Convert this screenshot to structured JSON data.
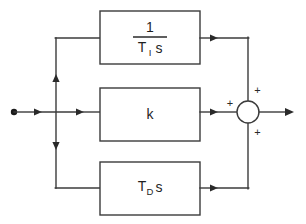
{
  "diagram": {
    "type": "control-block-diagram",
    "colors": {
      "line": "#3b3b3b",
      "text": "#1f1f1f",
      "background": "#ffffff",
      "arrow": "#2a2a2a"
    },
    "input": {
      "node_label": "",
      "dot_name": "input-node-dot"
    },
    "blocks": [
      {
        "id": "integral",
        "role": "integral-term",
        "numerator": "1",
        "denominator_base": "T",
        "denominator_subscript": "I",
        "denominator_suffix": "s",
        "plain_text": "1 / (T_I s)"
      },
      {
        "id": "proportional",
        "role": "proportional-term",
        "label": "k",
        "plain_text": "k"
      },
      {
        "id": "derivative",
        "role": "derivative-term",
        "base": "T",
        "subscript": "D",
        "suffix": "s",
        "plain_text": "T_D s"
      }
    ],
    "summing_junction": {
      "name": "summing-junction",
      "signs": {
        "left": "+",
        "top_right": "+",
        "bottom_right": "+"
      }
    },
    "output": {
      "label": ""
    }
  }
}
